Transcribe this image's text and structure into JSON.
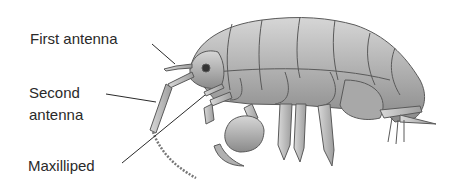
{
  "diagram": {
    "labels": [
      {
        "id": "first-antenna",
        "text": "First antenna"
      },
      {
        "id": "second-antenna",
        "text_line1": "Second",
        "text_line2": "antenna"
      },
      {
        "id": "maxilliped",
        "text": "Maxilliped"
      }
    ],
    "colors": {
      "body_fill": "#b9b9b9",
      "body_shade": "#8f8f8f",
      "outline": "#5a5a5a",
      "label_text": "#2a2a2a",
      "leader_line": "#2a2a2a"
    }
  }
}
